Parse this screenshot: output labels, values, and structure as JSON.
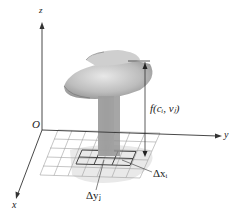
{
  "axes": {
    "z_label": "z",
    "y_label": "y",
    "x_label": "x",
    "origin_label": "O"
  },
  "annotations": {
    "height_label": "f(c_i, v_j)",
    "height_label_display": "f(cᵢ, vⱼ)",
    "delta_x_label": "Δxᵢ",
    "delta_y_label": "Δyⱼ"
  },
  "colors": {
    "axis": "#333333",
    "grid": "#999999",
    "surface_light": "#d4d4d4",
    "surface_dark": "#8a8a8a",
    "column": "#a8a8a8",
    "shadow": "#e6e6e6"
  }
}
